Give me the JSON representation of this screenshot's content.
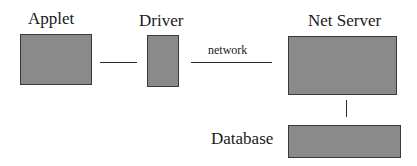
{
  "diagram": {
    "nodes": [
      {
        "id": "applet",
        "label": "Applet"
      },
      {
        "id": "driver",
        "label": "Driver"
      },
      {
        "id": "net_server",
        "label": "Net Server"
      },
      {
        "id": "database",
        "label": "Database"
      }
    ],
    "edges": [
      {
        "from": "applet",
        "to": "driver",
        "label": ""
      },
      {
        "from": "driver",
        "to": "net_server",
        "label": "network"
      },
      {
        "from": "net_server",
        "to": "database",
        "label": ""
      }
    ],
    "colors": {
      "box_fill": "#8a8a8a",
      "box_border": "#3a3a3a",
      "line": "#2a2a2a",
      "text": "#1a1a1a"
    }
  }
}
